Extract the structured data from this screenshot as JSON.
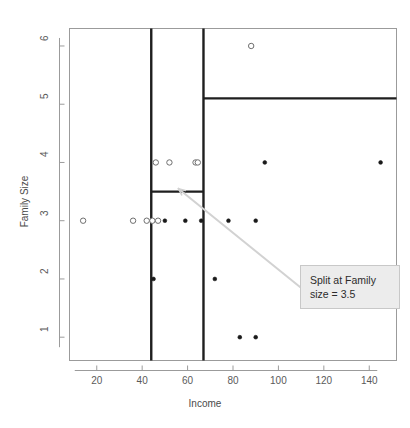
{
  "chart_data": {
    "type": "scatter",
    "title": "",
    "xlabel": "Income",
    "ylabel": "Family Size",
    "xlim": [
      8,
      152
    ],
    "ylim": [
      0.6,
      6.3
    ],
    "xticks": [
      20,
      40,
      60,
      80,
      100,
      120,
      140
    ],
    "yticks": [
      1,
      2,
      3,
      4,
      5,
      6
    ],
    "grid": false,
    "legend": null,
    "series": [
      {
        "name": "open-circle-points",
        "marker": "open-circle",
        "color": "#6f6f6f",
        "points": [
          {
            "x": 14,
            "y": 3
          },
          {
            "x": 36,
            "y": 3
          },
          {
            "x": 42,
            "y": 3
          },
          {
            "x": 44.5,
            "y": 3
          },
          {
            "x": 47,
            "y": 3
          },
          {
            "x": 46,
            "y": 4
          },
          {
            "x": 52,
            "y": 4
          },
          {
            "x": 63.5,
            "y": 4
          },
          {
            "x": 64.5,
            "y": 4
          },
          {
            "x": 88,
            "y": 6
          }
        ]
      },
      {
        "name": "filled-points",
        "marker": "filled-circle",
        "color": "#1a1a1a",
        "points": [
          {
            "x": 50,
            "y": 3
          },
          {
            "x": 59,
            "y": 3
          },
          {
            "x": 66,
            "y": 3
          },
          {
            "x": 78,
            "y": 3
          },
          {
            "x": 90,
            "y": 3
          },
          {
            "x": 94,
            "y": 4
          },
          {
            "x": 145,
            "y": 4
          },
          {
            "x": 45,
            "y": 2
          },
          {
            "x": 72,
            "y": 2
          },
          {
            "x": 83,
            "y": 1
          },
          {
            "x": 90,
            "y": 1
          }
        ]
      }
    ],
    "split_lines": [
      {
        "name": "vertical-split-income-44",
        "orientation": "vertical",
        "x": 44,
        "y_from": 0.6,
        "y_to": 6.3
      },
      {
        "name": "vertical-split-income-67",
        "orientation": "vertical",
        "x": 67,
        "y_from": 0.6,
        "y_to": 6.3
      },
      {
        "name": "horizontal-split-family-size-3.5",
        "orientation": "horizontal",
        "y": 3.5,
        "x_from": 44,
        "x_to": 67
      },
      {
        "name": "horizontal-split-family-size-5.1",
        "orientation": "horizontal",
        "y": 5.1,
        "x_from": 67,
        "x_to": 152
      }
    ],
    "annotations": [
      {
        "name": "split-annotation",
        "line1": "Split at Family",
        "line2": "size = 3.5",
        "target": {
          "x": 56,
          "y": 3.55
        },
        "box_fill": "#ececec",
        "box_border": "#c8c8c8",
        "leader_color": "#d2d2d2"
      }
    ],
    "colors": {
      "frame": "#9b9b9b",
      "axis": "#9b9b9b",
      "split_line": "#1f1f1f",
      "open_marker": "#6f6f6f",
      "filled_marker": "#1a1a1a",
      "tick_text": "#5a5a5a",
      "label_text": "#4a4a4a"
    }
  }
}
